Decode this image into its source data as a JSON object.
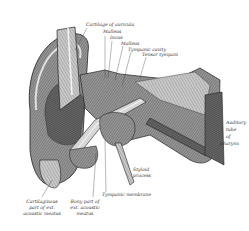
{
  "figure": {
    "labels": {
      "cartilage_of_auricula": "Cartilage of auricula",
      "malleus": "Malleus",
      "incus": "Incus",
      "malleus2": "Malleus",
      "tympanic_cavity": "Tympanic cavity",
      "tensor_tympani": "Tensor tympani",
      "pharynx_1": "Auditory",
      "pharynx_2": "tube",
      "pharynx_3": "of",
      "pharynx_4": "pharynx",
      "styloid_1": "Styloid",
      "styloid_2": "process",
      "tympanic_membrane": "Tympanic membrane",
      "cart_meatus_1": "Cartilaginous",
      "cart_meatus_2": "part of ext.",
      "cart_meatus_3": "acoustic meatus",
      "bony_meatus_1": "Bony part of",
      "bony_meatus_2": "ext. acoustic",
      "bony_meatus_3": "meatus"
    }
  }
}
